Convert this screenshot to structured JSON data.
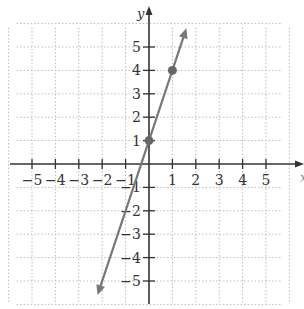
{
  "chart_data": {
    "type": "line",
    "title": "",
    "xlabel": "x",
    "ylabel": "y",
    "xlim": [
      -6,
      6
    ],
    "ylim": [
      -6,
      6
    ],
    "grid": true,
    "x_ticks": [
      -5,
      -4,
      -3,
      -2,
      -1,
      1,
      2,
      3,
      4,
      5
    ],
    "y_ticks": [
      -5,
      -4,
      -3,
      -2,
      -1,
      1,
      2,
      3,
      4,
      5
    ],
    "x_tick_labels": [
      "−5",
      "−4",
      "−3",
      "−2",
      "−1",
      "1",
      "2",
      "3",
      "4",
      "5"
    ],
    "y_tick_labels": [
      "−5",
      "−4",
      "−3",
      "−2",
      "−1",
      "1",
      "2",
      "3",
      "4",
      "5"
    ],
    "series": [
      {
        "name": "y = 3x + 1",
        "equation": "y = 3x + 1",
        "slope": 3,
        "intercept": 1,
        "points": [
          {
            "x": 0,
            "y": 1
          },
          {
            "x": 1,
            "y": 4
          }
        ],
        "line_extent": {
          "start": {
            "x": -2.2,
            "y": -5.6
          },
          "end": {
            "x": 1.6,
            "y": 5.8
          }
        },
        "color": "#777777"
      }
    ]
  },
  "axes": {
    "x_name": "x",
    "y_name": "y"
  },
  "colors": {
    "axis": "#333333",
    "grid": "#bbbbbb",
    "line": "#777777",
    "point": "#666666"
  }
}
